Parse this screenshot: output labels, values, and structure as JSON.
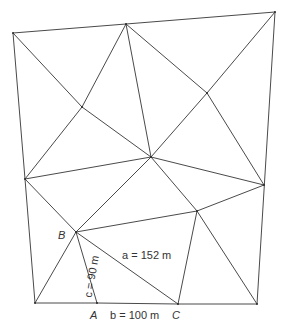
{
  "diagram": {
    "type": "triangulation-network",
    "line_color": "#4a4a4a",
    "vertices": {
      "P1": [
        13,
        33
      ],
      "P2": [
        126,
        24
      ],
      "P3": [
        275,
        12
      ],
      "P4": [
        82,
        107
      ],
      "P5": [
        207,
        93
      ],
      "P6": [
        151,
        157
      ],
      "P7": [
        25,
        179
      ],
      "P8": [
        264,
        185
      ],
      "P9": [
        197,
        211
      ],
      "B": [
        76,
        232
      ],
      "BL": [
        35,
        303
      ],
      "A": [
        97,
        303
      ],
      "C": [
        178,
        304
      ],
      "BR": [
        257,
        304
      ]
    },
    "edges": [
      [
        "P1",
        "P2"
      ],
      [
        "P2",
        "P3"
      ],
      [
        "P3",
        "BR"
      ],
      [
        "BR",
        "C"
      ],
      [
        "C",
        "A"
      ],
      [
        "A",
        "BL"
      ],
      [
        "BL",
        "P7"
      ],
      [
        "P7",
        "P1"
      ],
      [
        "P1",
        "P4"
      ],
      [
        "P4",
        "P6"
      ],
      [
        "P2",
        "P4"
      ],
      [
        "P4",
        "P7"
      ],
      [
        "P2",
        "P6"
      ],
      [
        "P2",
        "P5"
      ],
      [
        "P5",
        "P8"
      ],
      [
        "P3",
        "P5"
      ],
      [
        "P5",
        "P6"
      ],
      [
        "P7",
        "P6"
      ],
      [
        "P6",
        "P8"
      ],
      [
        "P7",
        "B"
      ],
      [
        "P6",
        "B"
      ],
      [
        "P6",
        "P9"
      ],
      [
        "B",
        "P9"
      ],
      [
        "P9",
        "P8"
      ],
      [
        "B",
        "BL"
      ],
      [
        "B",
        "A"
      ],
      [
        "B",
        "C"
      ],
      [
        "P9",
        "C"
      ],
      [
        "P9",
        "BR"
      ]
    ],
    "labels": {
      "point_B": "B",
      "point_A": "A",
      "point_C": "C",
      "side_a": "a = 152 m",
      "side_b": "b = 100 m",
      "side_c": "c = 90 m"
    }
  }
}
